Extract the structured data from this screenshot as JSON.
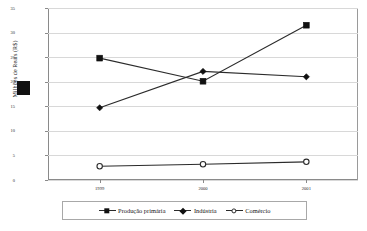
{
  "chart_data": {
    "type": "line",
    "title": "",
    "xlabel": "",
    "ylabel": "Milhões de Reais (R$)",
    "categories": [
      "1999",
      "2000",
      "2001"
    ],
    "ylim": [
      0,
      35
    ],
    "yticks": [
      0,
      5,
      10,
      15,
      20,
      25,
      30,
      35
    ],
    "ytick_labels": [
      "0",
      "5",
      "10",
      "15",
      "20",
      "25",
      "30",
      "35"
    ],
    "grid": true,
    "legend_position": "bottom",
    "series": [
      {
        "name": "Produção primária",
        "marker": "filled-square",
        "color": "#111111",
        "values": [
          24.8,
          20.1,
          31.5
        ]
      },
      {
        "name": "Indústria",
        "marker": "filled-diamond",
        "color": "#111111",
        "values": [
          14.7,
          22.1,
          21.0
        ]
      },
      {
        "name": "Comércio",
        "marker": "open-circle",
        "color": "#2b2b2b",
        "values": [
          2.8,
          3.2,
          3.7
        ]
      }
    ]
  },
  "artifact": {
    "name": "scan-smudge"
  }
}
